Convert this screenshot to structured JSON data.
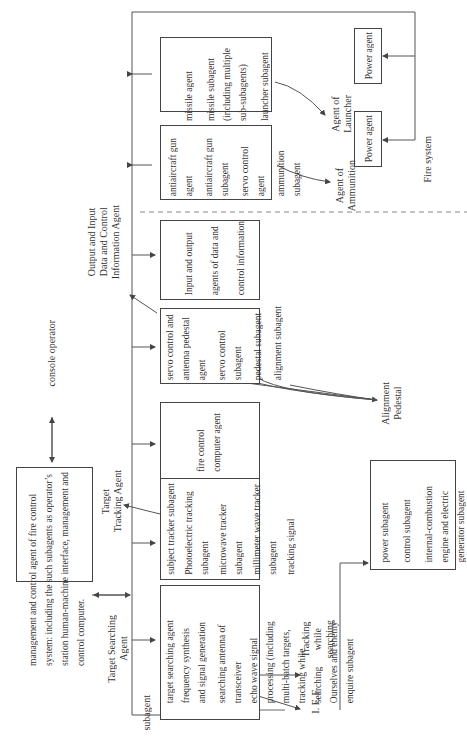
{
  "diagram": {
    "management_box": {
      "lines": [
        "management and control agent of fire control",
        "system: including the such subagents as operator’s",
        "station human-machine interface, management and",
        "control computer."
      ]
    },
    "console_operator": "console operator",
    "target_searching_agent_label": [
      "Target Searching",
      "Agent"
    ],
    "target_tracking_agent_label": [
      "Target",
      "Tracking Agent"
    ],
    "output_input_agent_label": [
      "Output and Input",
      "Data and Control",
      "Information Agent"
    ],
    "subagent_label": "subagent",
    "searching_box": {
      "lines": [
        "target searching agent",
        "frequency synthesis",
        "and signal generation",
        "searching antenna of",
        "transceiver",
        "echo wave signal",
        "processing (including",
        "multi-batch targets,",
        "tracking while",
        "searching",
        "Ourselves and enemy",
        "enquire subagent"
      ]
    },
    "tracking_box": {
      "lines": [
        "subject  tracker subagent",
        "Photoelectric tracking",
        "subagent",
        "microwave tracker",
        "subagent",
        "millimeter wave tracker",
        "subagent",
        "tracking signal"
      ]
    },
    "fire_control_box": {
      "lines": [
        "fire control",
        "computer agent"
      ]
    },
    "servo_box": {
      "lines": [
        "servo control and",
        "antenna pedestal",
        "agent",
        "servo control",
        "subagent",
        "pedestal subagent",
        "alignment subagent"
      ]
    },
    "io_box": {
      "lines": [
        "Input and output",
        "agents of data and",
        "control information"
      ]
    },
    "gun_box": {
      "lines": [
        "antiaircraft gun",
        "agent",
        "antiaircraft gun",
        "subagent",
        "servo control",
        "agent",
        "ammunition",
        "subagent"
      ]
    },
    "missile_box": {
      "lines": [
        "missile agent",
        "missile subagent",
        "(including multiple",
        "sub-subagents)",
        "launcher subagent"
      ]
    },
    "power_agent_1": "Power agent",
    "power_agent_2": "Power agent",
    "power_sub_box": {
      "lines": [
        "power subagent",
        "control subagent",
        "internal-combustion",
        "engine and electric",
        "generator subagent"
      ]
    },
    "iff_label": "I. F. F",
    "tracking_while_searching_label": [
      "Tracking",
      "while",
      "searching"
    ],
    "alignment_pedestal_label": [
      "Alignment",
      "Pedestal"
    ],
    "agent_of_ammunition_label": [
      "Agent of",
      "Ammunition"
    ],
    "agent_of_launcher_label": [
      "Agent of",
      "Launcher"
    ],
    "fire_system_label": "Fire system"
  }
}
